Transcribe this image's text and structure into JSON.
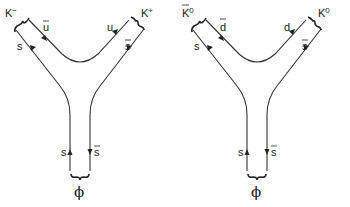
{
  "diagrams": [
    {
      "name": "phi-to-charged-kaons",
      "parent": "ϕ",
      "stem": {
        "left_quark": "s",
        "right_quark": "s",
        "right_is_bar": true
      },
      "left_meson": {
        "label": "K",
        "sup": "−",
        "bar": false,
        "outer_quark": "s",
        "outer_bar": false,
        "inner_quark": "u",
        "inner_bar": true
      },
      "right_meson": {
        "label": "K",
        "sup": "+",
        "bar": false,
        "inner_quark": "u",
        "inner_bar": false,
        "outer_quark": "s",
        "outer_bar": true
      }
    },
    {
      "name": "phi-to-neutral-kaons",
      "parent": "ϕ",
      "stem": {
        "left_quark": "s",
        "right_quark": "s",
        "right_is_bar": true
      },
      "left_meson": {
        "label": "K",
        "sup": "0",
        "bar": true,
        "outer_quark": "s",
        "outer_bar": false,
        "inner_quark": "d",
        "inner_bar": true
      },
      "right_meson": {
        "label": "K",
        "sup": "0",
        "bar": false,
        "inner_quark": "d",
        "inner_bar": false,
        "outer_quark": "s",
        "outer_bar": true
      }
    }
  ]
}
